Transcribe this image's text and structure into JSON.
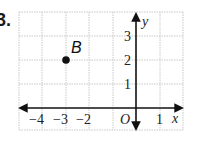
{
  "problem": {
    "number": "3."
  },
  "graph": {
    "x_axis_label": "x",
    "y_axis_label": "y",
    "origin_label": "O",
    "x_range": [
      -5,
      2
    ],
    "y_range": [
      -1,
      4
    ],
    "x_tick_labels": [
      "−4",
      "−3",
      "−2",
      "1"
    ],
    "y_tick_labels": [
      "3",
      "2",
      "1"
    ],
    "grid_color": "#c8c8c8",
    "axis_color": "#111111"
  },
  "points": [
    {
      "label": "B",
      "x": -3,
      "y": 2
    }
  ]
}
